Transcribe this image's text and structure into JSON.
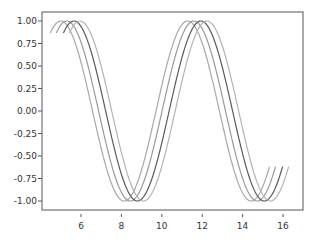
{
  "chart_data": {
    "type": "line",
    "title": "",
    "xlabel": "",
    "ylabel": "",
    "xlim": [
      4.0,
      16.9
    ],
    "ylim": [
      -1.1,
      1.1
    ],
    "grid": false,
    "legend": null,
    "x_ticks": [
      6,
      8,
      10,
      12,
      14,
      16
    ],
    "x_tick_labels": [
      "6",
      "8",
      "10",
      "12",
      "14",
      "16"
    ],
    "y_ticks": [
      1.0,
      0.75,
      0.5,
      0.25,
      0.0,
      -0.25,
      -0.5,
      -0.75,
      -1.0
    ],
    "y_tick_labels": [
      "1.00",
      "0.75",
      "0.50",
      "0.25",
      "0.00",
      "-0.25",
      "-0.50",
      "-0.75",
      "-1.00"
    ],
    "series": [
      {
        "name": "curve-1",
        "function": "cos(x - 5.0)",
        "x_start": 4.48,
        "x_end": 15.33,
        "color": "#a8a8a8",
        "peaks": [
          5.0,
          11.28
        ],
        "troughs": [
          8.14,
          14.42
        ]
      },
      {
        "name": "curve-2",
        "function": "cos(x - 5.3)",
        "x_start": 4.78,
        "x_end": 15.63,
        "color": "#9a9a9a",
        "peaks": [
          5.3,
          11.58
        ],
        "troughs": [
          8.44,
          14.72
        ]
      },
      {
        "name": "curve-3",
        "function": "cos(x - 5.65)",
        "x_start": 5.13,
        "x_end": 15.98,
        "color": "#5a5a5a",
        "peaks": [
          5.65,
          11.93
        ],
        "troughs": [
          8.79,
          15.07
        ]
      },
      {
        "name": "curve-4",
        "function": "cos(x - 5.95)",
        "x_start": 5.43,
        "x_end": 16.28,
        "color": "#b4b4b4",
        "peaks": [
          5.95,
          12.23
        ],
        "troughs": [
          9.09,
          15.37
        ]
      }
    ]
  }
}
